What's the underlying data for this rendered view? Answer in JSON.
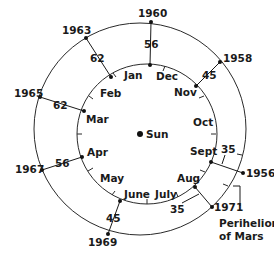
{
  "diagram": {
    "sun_label": "Sun",
    "perihelion_label_line1": "Perihelion",
    "perihelion_label_line2": "of Mars",
    "earth_orbit_months": [
      {
        "label": "Jan",
        "x": 96,
        "y": 76
      },
      {
        "label": "Dec",
        "x": 152,
        "y": 80
      },
      {
        "label": "Nov",
        "x": 174,
        "y": 95
      },
      {
        "label": "Oct",
        "x": 192,
        "y": 124
      },
      {
        "label": "Sept",
        "x": 186,
        "y": 155
      },
      {
        "label": "Aug",
        "x": 178,
        "y": 181
      },
      {
        "label": "July",
        "x": 150,
        "y": 200
      },
      {
        "label": "June",
        "x": 124,
        "y": 199
      },
      {
        "label": "May",
        "x": 100,
        "y": 181
      },
      {
        "label": "Apr",
        "x": 86,
        "y": 156
      },
      {
        "label": "Mar",
        "x": 84,
        "y": 125
      },
      {
        "label": "Feb",
        "x": 100,
        "y": 95
      }
    ],
    "oppositions": [
      {
        "year": "1956",
        "distance": "35",
        "year_x": 250,
        "year_y": 175,
        "dist_x": 224,
        "dist_y": 150
      },
      {
        "year": "1958",
        "distance": "45",
        "year_x": 221,
        "year_y": 62,
        "dist_x": 207,
        "dist_y": 78
      },
      {
        "year": "1960",
        "distance": "56",
        "year_x": 139,
        "year_y": 17,
        "dist_x": 145,
        "dist_y": 48
      },
      {
        "year": "1963",
        "distance": "62",
        "year_x": 62,
        "year_y": 34,
        "dist_x": 91,
        "dist_y": 61
      },
      {
        "year": "1965",
        "distance": "62",
        "year_x": 14,
        "year_y": 97,
        "dist_x": 58,
        "dist_y": 109
      },
      {
        "year": "1967",
        "distance": "56",
        "year_x": 15,
        "year_y": 171,
        "dist_x": 55,
        "dist_y": 166
      },
      {
        "year": "1969",
        "distance": "45",
        "year_x": 88,
        "year_y": 243,
        "dist_x": 110,
        "dist_y": 219
      },
      {
        "year": "1971",
        "distance": "35",
        "year_x": 213,
        "year_y": 209,
        "dist_x": 183,
        "dist_y": 209
      }
    ],
    "distance_unit": "million miles"
  }
}
